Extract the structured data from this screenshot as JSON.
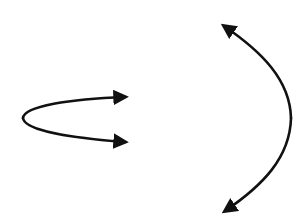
{
  "diagram": {
    "background": "#ffffff",
    "stroke_color": "#111111",
    "stroke_width": 2.6,
    "curves": [
      {
        "name": "left-parabola",
        "opens": "right",
        "vertex": [
          23,
          118
        ],
        "arrow_ends": [
          [
            127,
            97
          ],
          [
            127,
            142
          ]
        ]
      },
      {
        "name": "right-parabola",
        "opens": "left",
        "vertex": [
          291,
          118
        ],
        "arrow_ends": [
          [
            222,
            24
          ],
          [
            223,
            213
          ]
        ]
      }
    ]
  }
}
